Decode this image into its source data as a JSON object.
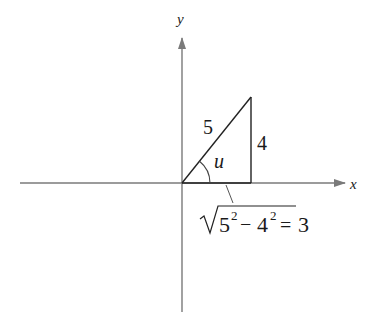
{
  "diagram": {
    "type": "right-triangle-on-axes",
    "axes": {
      "x_label": "x",
      "y_label": "y",
      "color": "#7a7a7a"
    },
    "triangle": {
      "hypotenuse_label": "5",
      "opposite_label": "4",
      "angle_label": "u",
      "line_color": "#222222"
    },
    "adjacent_formula": {
      "radical_base1": "5",
      "exp1": "2",
      "minus": "−",
      "radical_base2": "4",
      "exp2": "2",
      "equals": "=",
      "result": "3",
      "full_text": "√(5² − 4²) = 3"
    }
  }
}
